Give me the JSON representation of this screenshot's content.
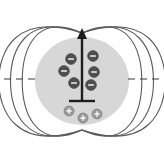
{
  "figure": {
    "canvas": {
      "width": 164,
      "height": 161,
      "background": "#ffffff"
    },
    "colors": {
      "field_line": "#5a5a5a",
      "body_fill": "#d7d7d7",
      "dipole_arrow": "#1d1d1d",
      "negative_charge": "#4f4f4f",
      "positive_charge": "#9a9a9a",
      "equator_dash": "#4a4a4a"
    },
    "body": {
      "name": "gray-body",
      "shape": "ellipse",
      "cx": 82,
      "cy": 81,
      "rx": 47,
      "ry": 44
    },
    "dipole_arrow": {
      "name": "dipole-moment-arrow",
      "direction": "up",
      "x": 82,
      "tip_y": 28,
      "tail_y": 101,
      "crossbar_half_width": 13,
      "crossbar_y": 101,
      "head_half_width": 5,
      "head_length": 11
    },
    "field_lines": {
      "count_per_side": 3,
      "sides": [
        "left",
        "right"
      ],
      "top_convergence": {
        "x": 82,
        "y": 33
      },
      "bottom_convergence": {
        "x": 82,
        "y": 130
      },
      "spread_x": [
        16,
        25,
        34
      ],
      "label": "magnetic field lines"
    },
    "equator_dashes": {
      "y": 79,
      "dash_length": 7,
      "dash_gap": 5,
      "left_start_x": 4,
      "left_end_x": 36,
      "right_start_x": 128,
      "right_end_x": 160
    },
    "charges": {
      "negative": {
        "symbol": "−",
        "count": 6,
        "radius": 5.4,
        "positions": [
          {
            "cx": 71,
            "cy": 59
          },
          {
            "cx": 64,
            "cy": 71
          },
          {
            "cx": 74,
            "cy": 83
          },
          {
            "cx": 93,
            "cy": 56
          },
          {
            "cx": 94,
            "cy": 72
          },
          {
            "cx": 91,
            "cy": 85
          }
        ]
      },
      "positive": {
        "symbol": "+",
        "count": 3,
        "radius": 5.0,
        "positions": [
          {
            "cx": 69,
            "cy": 111
          },
          {
            "cx": 83,
            "cy": 118
          },
          {
            "cx": 97,
            "cy": 114
          }
        ]
      }
    }
  }
}
